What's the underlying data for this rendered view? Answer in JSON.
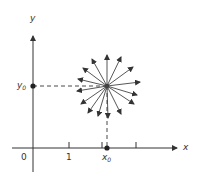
{
  "diagram": {
    "x_axis_label": "x",
    "y_axis_label": "y",
    "origin_label": "0",
    "tick_label_1": "1",
    "x0_label_base": "x",
    "x0_label_sub": "0",
    "y0_label_base": "y",
    "y0_label_sub": "0",
    "point_center": [
      107,
      86
    ],
    "arrow_count": 15,
    "colors": {
      "ink": "#333333",
      "background": "#ffffff"
    }
  }
}
